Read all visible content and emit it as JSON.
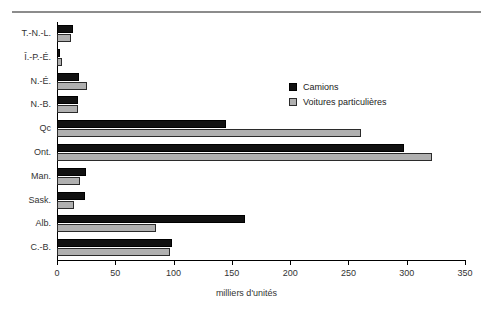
{
  "chart_data": {
    "type": "bar",
    "orientation": "horizontal",
    "title": "",
    "xlabel": "milliers d'unités",
    "ylabel": "",
    "xlim": [
      0,
      350
    ],
    "xticks": [
      0,
      50,
      100,
      150,
      200,
      250,
      300,
      350
    ],
    "xticklabels": [
      "0",
      "50",
      "100",
      "150",
      "200",
      "250",
      "300",
      "350"
    ],
    "grid": false,
    "legend_position": "upper-right-inside",
    "categories": [
      "T.-N.-L.",
      "Î.-P.-É.",
      "N.-É.",
      "N.-B.",
      "Qc",
      "Ont.",
      "Man.",
      "Sask.",
      "Alb.",
      "C.-B."
    ],
    "series": [
      {
        "name": "Camions",
        "color": "#111111",
        "values": [
          14,
          3,
          19,
          18,
          145,
          298,
          25,
          24,
          161,
          99
        ]
      },
      {
        "name": "Voitures particulières",
        "color": "#b0b0b0",
        "values": [
          12,
          4,
          26,
          18,
          261,
          322,
          20,
          15,
          85,
          97
        ]
      }
    ]
  },
  "legend": {
    "items": [
      {
        "label": "Camions"
      },
      {
        "label": "Voitures particulières"
      }
    ]
  }
}
